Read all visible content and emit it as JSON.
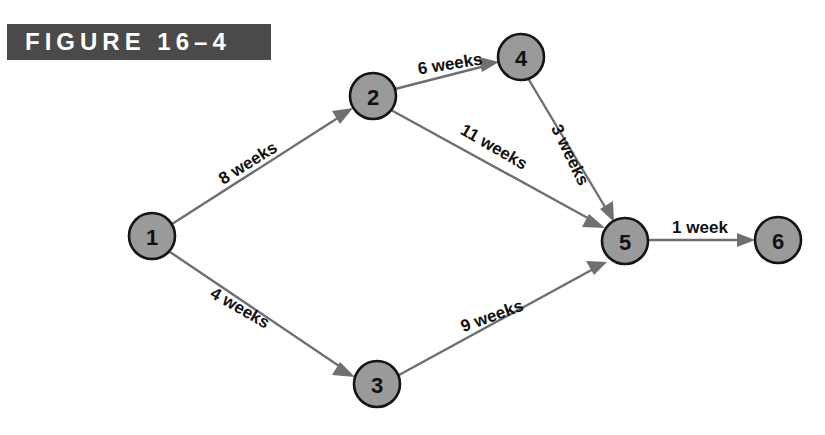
{
  "figure": {
    "banner_label": "FIGURE 16–4",
    "banner_bg": "#4a4a4a",
    "banner_text_color": "#ffffff"
  },
  "diagram": {
    "type": "activity-on-node-network",
    "node_fill": "#9a9a9a",
    "node_stroke": "#151515",
    "edge_color": "#6f6f6f",
    "background": "#ffffff",
    "nodes": [
      {
        "id": "1",
        "label": "1",
        "cx": 152,
        "cy": 236,
        "r": 23
      },
      {
        "id": "2",
        "label": "2",
        "cx": 373,
        "cy": 96,
        "r": 23
      },
      {
        "id": "3",
        "label": "3",
        "cx": 377,
        "cy": 384,
        "r": 23
      },
      {
        "id": "4",
        "label": "4",
        "cx": 521,
        "cy": 57,
        "r": 23
      },
      {
        "id": "5",
        "label": "5",
        "cx": 625,
        "cy": 241,
        "r": 23
      },
      {
        "id": "6",
        "label": "6",
        "cx": 778,
        "cy": 240,
        "r": 23
      }
    ],
    "edges": [
      {
        "from": "1",
        "to": "2",
        "label": "8 weeks",
        "weeks": 8,
        "label_x": 248,
        "label_y": 163,
        "label_rotate": -32
      },
      {
        "from": "2",
        "to": "4",
        "label": "6 weeks",
        "weeks": 6,
        "label_x": 450,
        "label_y": 64,
        "label_rotate": -9
      },
      {
        "from": "2",
        "to": "5",
        "label": "11 weeks",
        "weeks": 11,
        "label_x": 494,
        "label_y": 147,
        "label_rotate": 30
      },
      {
        "from": "4",
        "to": "5",
        "label": "3 weeks",
        "weeks": 3,
        "label_x": 570,
        "label_y": 155,
        "label_rotate": 64
      },
      {
        "from": "1",
        "to": "3",
        "label": "4 weeks",
        "weeks": 4,
        "label_x": 240,
        "label_y": 308,
        "label_rotate": 30
      },
      {
        "from": "3",
        "to": "5",
        "label": "9 weeks",
        "weeks": 9,
        "label_x": 492,
        "label_y": 316,
        "label_rotate": -20
      },
      {
        "from": "5",
        "to": "6",
        "label": "1 week",
        "weeks": 1,
        "label_x": 700,
        "label_y": 227,
        "label_rotate": 0
      }
    ]
  }
}
